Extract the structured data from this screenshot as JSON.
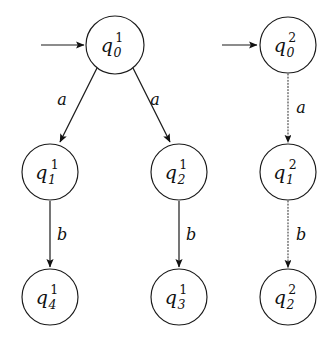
{
  "figure": {
    "kind": "finite-automata-diagram",
    "background_color": "#ffffff",
    "ink_color": "#111111",
    "dotted_edge_color": "#404040"
  },
  "automata": [
    {
      "id": "automaton-1",
      "superscript": "1",
      "edge_style": "solid",
      "start_arrow": {
        "label": "",
        "target": "q0-1"
      },
      "states": [
        {
          "id": "q0-1",
          "base": "q",
          "sub": "0",
          "sup": "1",
          "cx": 115,
          "cy": 45,
          "r": 29
        },
        {
          "id": "q1-1",
          "base": "q",
          "sub": "1",
          "sup": "1",
          "cx": 50,
          "cy": 172,
          "r": 28
        },
        {
          "id": "q2-1",
          "base": "q",
          "sub": "2",
          "sup": "1",
          "cx": 179,
          "cy": 172,
          "r": 28
        },
        {
          "id": "q4-1",
          "base": "q",
          "sub": "4",
          "sup": "1",
          "cx": 50,
          "cy": 297,
          "r": 28
        },
        {
          "id": "q3-1",
          "base": "q",
          "sub": "3",
          "sup": "1",
          "cx": 179,
          "cy": 297,
          "r": 28
        }
      ],
      "transitions": [
        {
          "id": "t-q0-q1-a",
          "from": "q0-1",
          "to": "q1-1",
          "label": "a",
          "label_x": 62,
          "label_y": 105
        },
        {
          "id": "t-q0-q2-a",
          "from": "q0-1",
          "to": "q2-1",
          "label": "a",
          "label_x": 155,
          "label_y": 105
        },
        {
          "id": "t-q1-q4-b",
          "from": "q1-1",
          "to": "q4-1",
          "label": "b",
          "label_x": 62,
          "label_y": 240
        },
        {
          "id": "t-q2-q3-b",
          "from": "q2-1",
          "to": "q3-1",
          "label": "b",
          "label_x": 191,
          "label_y": 240
        }
      ]
    },
    {
      "id": "automaton-2",
      "superscript": "2",
      "edge_style": "dotted",
      "start_arrow": {
        "label": "",
        "target": "q0-2"
      },
      "states": [
        {
          "id": "q0-2",
          "base": "q",
          "sub": "0",
          "sup": "2",
          "cx": 288,
          "cy": 45,
          "r": 28
        },
        {
          "id": "q1-2",
          "base": "q",
          "sub": "1",
          "sup": "2",
          "cx": 288,
          "cy": 172,
          "r": 28
        },
        {
          "id": "q2-2",
          "base": "q",
          "sub": "2",
          "sup": "2",
          "cx": 288,
          "cy": 297,
          "r": 28
        }
      ],
      "transitions": [
        {
          "id": "t2-q0-q1-a",
          "from": "q0-2",
          "to": "q1-2",
          "label": "a",
          "label_x": 300,
          "label_y": 113
        },
        {
          "id": "t2-q1-q2-b",
          "from": "q1-2",
          "to": "q2-2",
          "label": "b",
          "label_x": 300,
          "label_y": 240
        }
      ]
    }
  ],
  "alphabet": [
    "a",
    "b"
  ]
}
